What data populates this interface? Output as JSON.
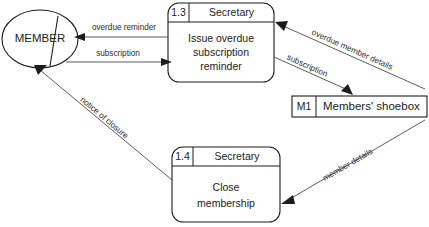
{
  "diagram": {
    "type": "data-flow-diagram",
    "title": "",
    "external_entities": [
      {
        "id": "member",
        "label": "MEMBER",
        "shape": "ellipse-with-duplicate-marker"
      }
    ],
    "processes": [
      {
        "id": "1.3",
        "number": "1.3",
        "role": "Secretary",
        "body_lines": [
          "Issue overdue",
          "subscription",
          "reminder"
        ],
        "body_text": "Issue overdue subscription reminder"
      },
      {
        "id": "1.4",
        "number": "1.4",
        "role": "Secretary",
        "body_lines": [
          "Close",
          "membership"
        ],
        "body_text": "Close membership"
      }
    ],
    "data_stores": [
      {
        "id": "M1",
        "number": "M1",
        "label": "Members' shoebox"
      }
    ],
    "flows": [
      {
        "id": "flow-overdue-reminder",
        "label": "overdue reminder",
        "from": "1.3",
        "to": "member",
        "orientation": "horizontal"
      },
      {
        "id": "flow-subscription-member",
        "label": "subscription",
        "from": "member",
        "to": "1.3",
        "orientation": "horizontal"
      },
      {
        "id": "flow-overdue-member-details",
        "label": "overdue member details",
        "from": "M1",
        "to": "1.3",
        "orientation": "diagonal"
      },
      {
        "id": "flow-subscription-store",
        "label": "subscription",
        "from": "1.3",
        "to": "M1",
        "orientation": "diagonal"
      },
      {
        "id": "flow-member-details",
        "label": "member details",
        "from": "M1",
        "to": "1.4",
        "orientation": "diagonal"
      },
      {
        "id": "flow-notice-of-closure",
        "label": "notice of closure",
        "from": "1.4",
        "to": "member",
        "orientation": "diagonal"
      }
    ],
    "colors": {
      "background": "#ffffff",
      "stroke": "#1c1c1c",
      "flow_stroke": "#4a4a4a",
      "text": "#1a1a1a"
    }
  }
}
